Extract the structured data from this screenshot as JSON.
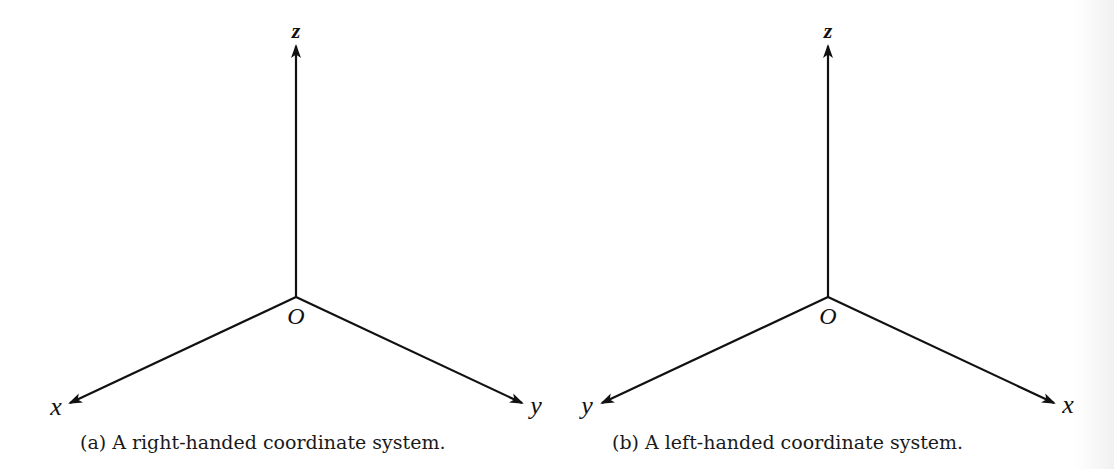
{
  "figure": {
    "panels": [
      {
        "id": "a",
        "caption": "(a) A right-handed coordinate system.",
        "handedness": "right",
        "origin_label": "O",
        "axes": {
          "z": {
            "label": "z",
            "direction": "up"
          },
          "x": {
            "label": "x",
            "direction": "down-left"
          },
          "y": {
            "label": "y",
            "direction": "down-right"
          }
        }
      },
      {
        "id": "b",
        "caption": "(b) A left-handed coordinate system.",
        "handedness": "left",
        "origin_label": "O",
        "axes": {
          "z": {
            "label": "z",
            "direction": "up"
          },
          "y": {
            "label": "y",
            "direction": "down-left"
          },
          "x": {
            "label": "x",
            "direction": "down-right"
          }
        }
      }
    ]
  },
  "colors": {
    "ink": "#111111",
    "background": "#ffffff"
  }
}
